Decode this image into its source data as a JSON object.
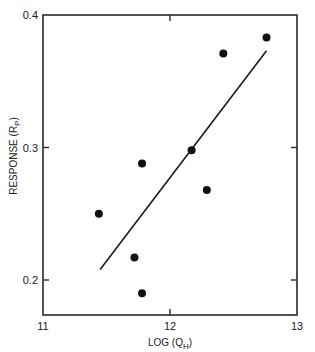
{
  "chart_data": {
    "type": "scatter",
    "title": "",
    "xlabel": "LOG (Q_H)",
    "xlabel_main": "LOG (Q",
    "xlabel_sub": "H",
    "xlabel_close": ")",
    "ylabel": "RESPONSE (R_P)",
    "ylabel_main": "RESPONSE (R",
    "ylabel_sub": "P",
    "ylabel_close": ")",
    "xlim": [
      11,
      13
    ],
    "ylim": [
      0.175,
      0.4
    ],
    "x_ticks": [
      "11",
      "12",
      "13"
    ],
    "y_ticks": [
      "0.2",
      "0.3",
      "0.4"
    ],
    "grid": false,
    "legend": null,
    "series": [
      {
        "name": "observations",
        "type": "scatter",
        "x": [
          11.44,
          11.72,
          11.78,
          11.78,
          12.17,
          12.29,
          12.42,
          12.76
        ],
        "y": [
          0.25,
          0.217,
          0.288,
          0.19,
          0.298,
          0.268,
          0.371,
          0.383
        ]
      },
      {
        "name": "regression-fit",
        "type": "line",
        "x": [
          11.45,
          12.76
        ],
        "y": [
          0.208,
          0.373
        ]
      }
    ]
  }
}
